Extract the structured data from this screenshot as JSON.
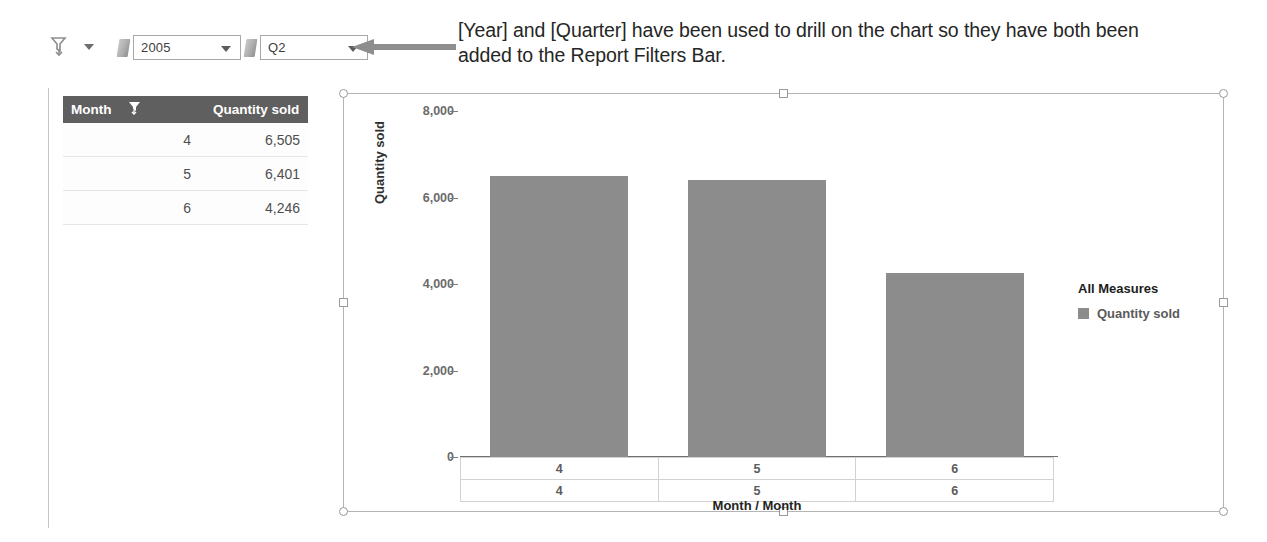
{
  "filter_bar": {
    "toolbar_icon": "drill-filter-icon",
    "toolbar_caret": "chevron-down-icon",
    "filters": [
      {
        "tag_icon": "page-tag-icon",
        "name": "year",
        "value": "2005",
        "caret": "chevron-down-icon"
      },
      {
        "tag_icon": "page-tag-icon",
        "name": "quarter",
        "value": "Q2",
        "caret": "chevron-down-icon"
      }
    ],
    "pointer_arrow": "left-arrow-annotation"
  },
  "callout": {
    "text": "[Year] and [Quarter] have been used to drill on the chart so they have both been added to the Report Filters Bar."
  },
  "table": {
    "headers": [
      "Month",
      "Quantity sold"
    ],
    "header_icon": "drill-filter-icon",
    "rows": [
      {
        "month": "4",
        "quantity_sold": "6,505"
      },
      {
        "month": "5",
        "quantity_sold": "6,401"
      },
      {
        "month": "6",
        "quantity_sold": "4,246"
      }
    ]
  },
  "chart_data": {
    "type": "bar",
    "title": "",
    "categories": [
      "4",
      "5",
      "6"
    ],
    "values": [
      6505,
      6401,
      4246
    ],
    "series": [
      {
        "name": "Quantity sold",
        "values": [
          6505,
          6401,
          4246
        ],
        "color": "#8c8c8c"
      }
    ],
    "xlabel": "Month / Month",
    "ylabel": "Quantity sold",
    "ylim": [
      0,
      8000
    ],
    "yticks": [
      0,
      2000,
      4000,
      6000,
      8000
    ],
    "ytick_labels": [
      "0",
      "2,000",
      "4,000",
      "6,000",
      "8,000"
    ],
    "x_label_rows": [
      [
        "4",
        "5",
        "6"
      ],
      [
        "4",
        "5",
        "6"
      ]
    ],
    "grid": false,
    "legend_position": "right",
    "legend_title": "All Measures",
    "bar_color": "#8c8c8c"
  },
  "colors": {
    "bar": "#8c8c8c",
    "table_header_bg": "#5f5f5f",
    "frame_border": "#b3b3b3",
    "arrow": "#8e8e8e"
  }
}
